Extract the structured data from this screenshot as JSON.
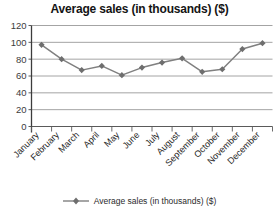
{
  "chart_data": {
    "type": "line",
    "title": "Average sales (in thousands) ($)",
    "xlabel": "",
    "ylabel": "",
    "categories": [
      "January",
      "February",
      "March",
      "April",
      "May",
      "June",
      "July",
      "August",
      "September",
      "October",
      "November",
      "December"
    ],
    "series": [
      {
        "name": "Average sales (in thousands) ($)",
        "values": [
          97,
          80,
          67,
          72,
          61,
          70,
          76,
          81,
          65,
          68,
          92,
          99
        ],
        "color": "#808080",
        "marker": "diamond"
      }
    ],
    "ylim": [
      0,
      120
    ],
    "yticks": [
      0,
      20,
      40,
      60,
      80,
      100,
      120
    ],
    "ytick_labels": [
      "0",
      "20",
      "40",
      "60",
      "80",
      "100",
      "120"
    ],
    "grid": true,
    "grid_axis": "y",
    "legend_position": "bottom"
  },
  "legend": {
    "marker_icon": "diamond-marker-icon",
    "label": "Average sales (in thousands) ($)"
  }
}
